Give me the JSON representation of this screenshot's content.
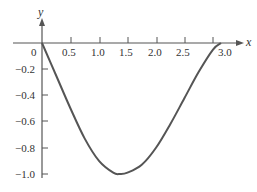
{
  "chart_data": {
    "type": "line",
    "title": "",
    "xlabel": "x",
    "ylabel": "y",
    "xlim": [
      0,
      3.14
    ],
    "ylim": [
      -1.0,
      0
    ],
    "grid": false,
    "legend": null,
    "x_ticks": [
      "0",
      "0.5",
      "1.0",
      "1.5",
      "2.0",
      "2.5",
      "3.0"
    ],
    "y_ticks": [
      "-0.2",
      "-0.4",
      "-0.6",
      "-0.8",
      "-1.0"
    ],
    "series": [
      {
        "name": "curve",
        "color": "#555555",
        "x": [
          0,
          0.25,
          0.5,
          0.75,
          1.0,
          1.25,
          1.37,
          1.5,
          1.75,
          2.0,
          2.25,
          2.5,
          2.75,
          3.0,
          3.14
        ],
        "y": [
          0,
          -0.25,
          -0.5,
          -0.73,
          -0.9,
          -0.99,
          -1.0,
          -0.99,
          -0.93,
          -0.8,
          -0.62,
          -0.42,
          -0.22,
          -0.05,
          0
        ]
      }
    ]
  },
  "labels": {
    "x_axis": "x",
    "y_axis": "y",
    "origin": "0",
    "xt": [
      "0.5",
      "1.0",
      "1.5",
      "2.0",
      "2.5",
      "3.0"
    ],
    "yt": [
      "−0.2",
      "−0.4",
      "−0.6",
      "−0.8",
      "−1.0"
    ]
  }
}
